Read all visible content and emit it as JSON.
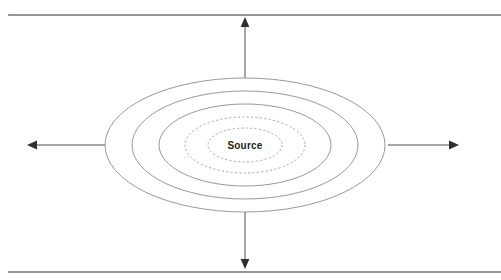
{
  "diagram": {
    "center_label": "Source",
    "colors": {
      "background": "#ffffff",
      "boundary_line": "#6f7174",
      "contour_solid": "#8b8d90",
      "contour_dashed": "#9a9c9f",
      "arrow_line": "#86888b",
      "arrow_head": "#2e2f31",
      "label_text": "#1d1e20"
    },
    "boundaries": [
      {
        "name": "top-boundary",
        "y": 15,
        "x1": 8,
        "x2": 501
      },
      {
        "name": "bottom-boundary",
        "y": 272,
        "x1": 8,
        "x2": 501
      }
    ],
    "contours": [
      {
        "name": "contour-1-outermost",
        "rx": 140,
        "ry": 67,
        "style": "solid"
      },
      {
        "name": "contour-2",
        "rx": 113,
        "ry": 54,
        "style": "solid"
      },
      {
        "name": "contour-3",
        "rx": 86,
        "ry": 41,
        "style": "solid"
      },
      {
        "name": "contour-4",
        "rx": 60,
        "ry": 28,
        "style": "dashed"
      },
      {
        "name": "contour-5-innermost",
        "rx": 37,
        "ry": 17,
        "style": "dashed"
      }
    ],
    "center": {
      "cx": 245,
      "cy": 145
    },
    "arrows": [
      {
        "name": "arrow-up",
        "direction": "up",
        "from_x": 245,
        "from_y": 78,
        "to_x": 245,
        "to_y": 18
      },
      {
        "name": "arrow-down",
        "direction": "down",
        "from_x": 245,
        "from_y": 212,
        "to_x": 245,
        "to_y": 268
      },
      {
        "name": "arrow-left",
        "direction": "left",
        "from_x": 105,
        "from_y": 145,
        "to_x": 28,
        "to_y": 145
      },
      {
        "name": "arrow-right",
        "direction": "right",
        "from_x": 388,
        "from_y": 145,
        "to_x": 458,
        "to_y": 145
      }
    ]
  }
}
